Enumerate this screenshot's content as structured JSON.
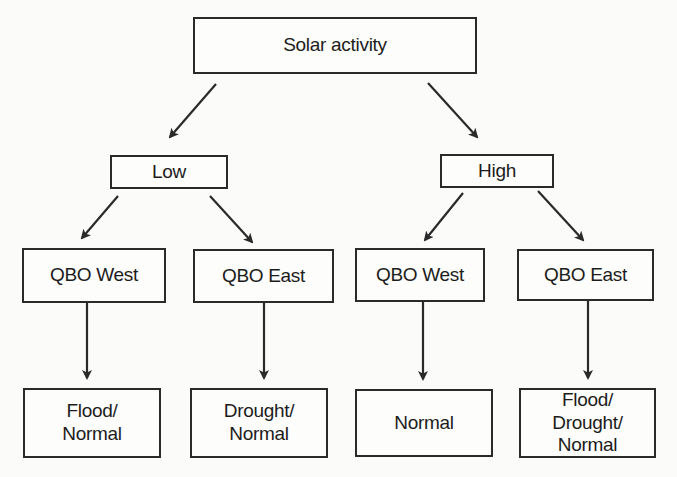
{
  "diagram": {
    "type": "tree",
    "root": {
      "id": "solar",
      "label": "Solar activity",
      "box": {
        "x": 193,
        "y": 17,
        "w": 284,
        "h": 57
      }
    },
    "level1": [
      {
        "id": "low",
        "label": "Low",
        "box": {
          "x": 110,
          "y": 155,
          "w": 118,
          "h": 34
        }
      },
      {
        "id": "high",
        "label": "High",
        "box": {
          "x": 440,
          "y": 154,
          "w": 114,
          "h": 34
        }
      }
    ],
    "level2": [
      {
        "id": "low_west",
        "parent": "low",
        "label": "QBO West",
        "box": {
          "x": 22,
          "y": 248,
          "w": 144,
          "h": 55
        }
      },
      {
        "id": "low_east",
        "parent": "low",
        "label": "QBO East",
        "box": {
          "x": 193,
          "y": 249,
          "w": 141,
          "h": 54
        }
      },
      {
        "id": "high_west",
        "parent": "high",
        "label": "QBO West",
        "box": {
          "x": 355,
          "y": 248,
          "w": 130,
          "h": 54
        }
      },
      {
        "id": "high_east",
        "parent": "high",
        "label": "QBO East",
        "box": {
          "x": 517,
          "y": 249,
          "w": 137,
          "h": 52
        }
      }
    ],
    "level3": [
      {
        "id": "out1",
        "parent": "low_west",
        "label": "Flood/\nNormal",
        "box": {
          "x": 23,
          "y": 388,
          "w": 138,
          "h": 70
        }
      },
      {
        "id": "out2",
        "parent": "low_east",
        "label": "Drought/\nNormal",
        "box": {
          "x": 190,
          "y": 388,
          "w": 138,
          "h": 70
        }
      },
      {
        "id": "out3",
        "parent": "high_west",
        "label": "Normal",
        "box": {
          "x": 355,
          "y": 389,
          "w": 138,
          "h": 68
        }
      },
      {
        "id": "out4",
        "parent": "high_east",
        "label": "Flood/\nDrought/\nNormal",
        "box": {
          "x": 519,
          "y": 388,
          "w": 137,
          "h": 70
        }
      }
    ],
    "edges": [
      {
        "from": "solar",
        "to": "low",
        "x1": 216,
        "y1": 84,
        "x2": 170,
        "y2": 137
      },
      {
        "from": "solar",
        "to": "high",
        "x1": 428,
        "y1": 83,
        "x2": 477,
        "y2": 137
      },
      {
        "from": "low",
        "to": "low_west",
        "x1": 118,
        "y1": 196,
        "x2": 82,
        "y2": 238
      },
      {
        "from": "low",
        "to": "low_east",
        "x1": 210,
        "y1": 196,
        "x2": 252,
        "y2": 242
      },
      {
        "from": "high",
        "to": "high_west",
        "x1": 463,
        "y1": 193,
        "x2": 425,
        "y2": 240
      },
      {
        "from": "high",
        "to": "high_east",
        "x1": 538,
        "y1": 191,
        "x2": 583,
        "y2": 240
      },
      {
        "from": "low_west",
        "to": "out1",
        "x1": 87,
        "y1": 303,
        "x2": 87,
        "y2": 378
      },
      {
        "from": "low_east",
        "to": "out2",
        "x1": 264,
        "y1": 303,
        "x2": 264,
        "y2": 378
      },
      {
        "from": "high_west",
        "to": "out3",
        "x1": 423,
        "y1": 302,
        "x2": 423,
        "y2": 379
      },
      {
        "from": "high_east",
        "to": "out4",
        "x1": 588,
        "y1": 301,
        "x2": 588,
        "y2": 378
      }
    ],
    "colors": {
      "line": "#2a2a2a",
      "box_border": "#2a2a2a",
      "text": "#1c1c1c",
      "background": "#fbfbf9"
    }
  }
}
